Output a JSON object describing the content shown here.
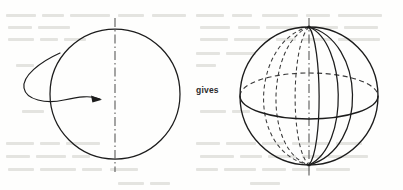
{
  "figure": {
    "kind": "line-diagram",
    "caption_text": "gives",
    "background_color": "#fefefd",
    "ink_color": "#1c1c1c",
    "ghost_text_color": "#c9c9c4",
    "left_shape": {
      "name": "circle",
      "center_x": 115,
      "center_y": 94,
      "radius": 65,
      "axis": {
        "style": "dash-dot",
        "x": 115,
        "y_top": 18,
        "y_bottom": 172
      },
      "rotation_arrow": {
        "name": "rotation-arrow",
        "direction": "counterclockwise-into-page",
        "arrowhead": "right"
      }
    },
    "right_shape": {
      "name": "sphere",
      "center_x": 309,
      "center_y": 96,
      "radius": 69,
      "axis": {
        "style": "dash-dot",
        "x": 309,
        "y_top": 18,
        "y_bottom": 176
      },
      "equator": {
        "rx": 69,
        "ry": 23,
        "front_style": "solid",
        "back_style": "dashed"
      },
      "meridians_front_solid": [
        0.18,
        0.52,
        0.84
      ],
      "meridians_back_dashed": [
        -0.82,
        -0.48,
        -0.16
      ]
    }
  },
  "colors": {
    "ink": "#1c1c1c",
    "paper": "#fefefd",
    "ghost": "#c9c9c4"
  }
}
